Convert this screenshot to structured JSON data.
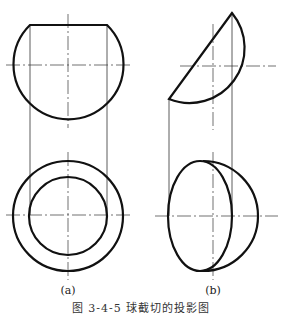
{
  "figure": {
    "caption": "图 3-4-5  球截切的投影图",
    "panels": [
      {
        "id": "a",
        "label": "(a)",
        "description": "Sphere truncated by horizontal plane: front view with flat top, top view with two concentric circles"
      },
      {
        "id": "b",
        "label": "(b)",
        "description": "Sphere truncated by inclined plane: front view with oblique cut, top view with ellipse inside circle"
      }
    ]
  },
  "colors": {
    "outline": "#111111",
    "thin": "#333333",
    "background": "#ffffff"
  }
}
